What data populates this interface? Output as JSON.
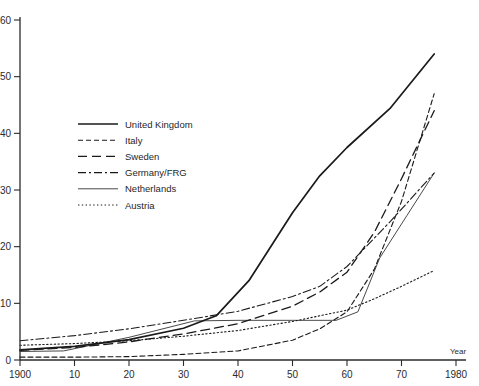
{
  "chart_data": {
    "type": "line",
    "title": "",
    "xlabel": "Year",
    "ylabel": "",
    "xlim": [
      1900,
      1980
    ],
    "ylim": [
      0,
      60
    ],
    "grid": false,
    "legend_position": "upper-left-inside",
    "x_ticks": [
      {
        "value": 1900,
        "label": "1900"
      },
      {
        "value": 1910,
        "label": "10"
      },
      {
        "value": 1920,
        "label": "20"
      },
      {
        "value": 1930,
        "label": "30"
      },
      {
        "value": 1940,
        "label": "40"
      },
      {
        "value": 1950,
        "label": "50"
      },
      {
        "value": 1960,
        "label": "60"
      },
      {
        "value": 1970,
        "label": "70"
      },
      {
        "value": 1980,
        "label": "1980"
      }
    ],
    "y_ticks": [
      {
        "value": 0,
        "label": "0"
      },
      {
        "value": 10,
        "label": "10"
      },
      {
        "value": 20,
        "label": "20"
      },
      {
        "value": 30,
        "label": "30"
      },
      {
        "value": 40,
        "label": "40"
      },
      {
        "value": 50,
        "label": "50"
      },
      {
        "value": 60,
        "label": "60"
      }
    ],
    "series": [
      {
        "name": "United Kingdom",
        "style": "solid",
        "stroke_width": 1.7,
        "dasharray": "none",
        "x": [
          1900,
          1910,
          1920,
          1930,
          1936,
          1942,
          1950,
          1955,
          1960,
          1968,
          1976
        ],
        "y": [
          1.8,
          2.4,
          3.6,
          5.6,
          7.8,
          14.0,
          26.0,
          32.5,
          37.5,
          44.5,
          54.0
        ]
      },
      {
        "name": "Italy",
        "style": "dashed-short",
        "stroke_width": 1.1,
        "dasharray": "5,3",
        "x": [
          1900,
          1910,
          1920,
          1930,
          1940,
          1950,
          1955,
          1960,
          1965,
          1970,
          1976
        ],
        "y": [
          0.5,
          0.5,
          0.6,
          1.0,
          1.6,
          3.5,
          5.5,
          8.5,
          16.0,
          28.0,
          47.0
        ]
      },
      {
        "name": "Sweden",
        "style": "dashed-long",
        "stroke_width": 1.3,
        "dasharray": "9,5",
        "x": [
          1900,
          1910,
          1920,
          1930,
          1940,
          1950,
          1955,
          1960,
          1965,
          1970,
          1976
        ],
        "y": [
          1.7,
          2.2,
          3.2,
          4.6,
          6.4,
          9.5,
          12.0,
          15.5,
          22.5,
          32.0,
          44.0
        ]
      },
      {
        "name": "Germany/FRG",
        "style": "dash-dot",
        "stroke_width": 1.1,
        "dasharray": "8,3,2,3",
        "x": [
          1900,
          1910,
          1920,
          1930,
          1940,
          1950,
          1955,
          1960,
          1968,
          1976
        ],
        "y": [
          3.4,
          4.3,
          5.5,
          7.0,
          8.6,
          11.2,
          13.0,
          16.5,
          24.5,
          33.0
        ]
      },
      {
        "name": "Netherlands",
        "style": "solid-thin",
        "stroke_width": 0.8,
        "dasharray": "none",
        "x": [
          1900,
          1908,
          1920,
          1932,
          1940,
          1950,
          1958,
          1962,
          1966,
          1971,
          1976
        ],
        "y": [
          1.5,
          1.6,
          4.0,
          6.9,
          7.0,
          7.0,
          7.0,
          8.5,
          18.0,
          25.5,
          33.0
        ]
      },
      {
        "name": "Austria",
        "style": "dotted",
        "stroke_width": 1.1,
        "dasharray": "1.4,2.4",
        "x": [
          1900,
          1910,
          1920,
          1930,
          1940,
          1950,
          1955,
          1960,
          1965,
          1970,
          1976
        ],
        "y": [
          2.6,
          2.9,
          3.4,
          4.2,
          5.2,
          6.8,
          7.8,
          8.8,
          10.8,
          13.0,
          15.8
        ]
      }
    ]
  },
  "legend": {
    "entries": [
      {
        "label": "United Kingdom"
      },
      {
        "label": "Italy"
      },
      {
        "label": "Sweden"
      },
      {
        "label": "Germany/FRG"
      },
      {
        "label": "Netherlands"
      },
      {
        "label": "Austria"
      }
    ]
  },
  "colors": {
    "ink": "#1a1a1a",
    "axis": "#2b2b2b",
    "background": "#ffffff"
  }
}
